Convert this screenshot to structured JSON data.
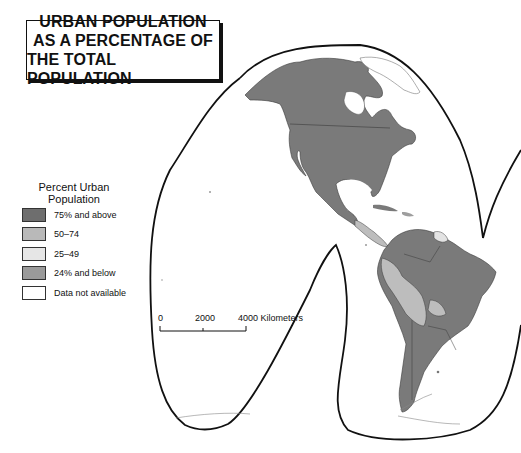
{
  "title": {
    "lines": [
      "URBAN POPULATION",
      "AS A PERCENTAGE OF",
      "THE TOTAL POPULATION"
    ]
  },
  "legend": {
    "title_line1": "Percent Urban",
    "title_line2": "Population",
    "items": [
      {
        "label": "75% and above",
        "color": "#6e6e6e"
      },
      {
        "label": "50–74",
        "color": "#b9b9b9"
      },
      {
        "label": "25–49",
        "color": "#e6e6e6"
      },
      {
        "label": "24% and below",
        "color": "#9a9a9a"
      },
      {
        "label": "Data not available",
        "color": "#ffffff"
      }
    ]
  },
  "scale_bar": {
    "ticks": [
      "0",
      "2000",
      "4000 Kilometers"
    ]
  },
  "map": {
    "projection": "interrupted (Goode homolosine style)",
    "region": "Americas",
    "colors": {
      "land_high": "#7a7a7a",
      "land_mid": "#bdbdbd",
      "land_low_mid": "#e3e3e3",
      "land_low": "#9e9e9e",
      "outline": "#111111",
      "border": "#3a3a3a"
    }
  }
}
